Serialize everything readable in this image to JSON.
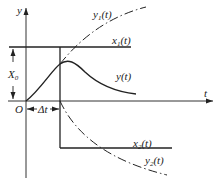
{
  "diagram": {
    "type": "signal-response-plot",
    "axes": {
      "y_label": "y",
      "x_label": "t",
      "origin_label": "O"
    },
    "annotations": {
      "x0_label": "X",
      "x0_sub": "0",
      "delay_label": "Δt"
    },
    "curves": [
      {
        "name": "y1",
        "label": "y",
        "sub": "1",
        "arg": "(t)",
        "style": "dash-dot",
        "description": "rising curve"
      },
      {
        "name": "x1",
        "label": "x",
        "sub": "1",
        "arg": "(t)",
        "style": "solid",
        "description": "step input of height X0 at t=Δt"
      },
      {
        "name": "y",
        "label": "y",
        "sub": "",
        "arg": "(t)",
        "style": "solid",
        "description": "output rising to peak at Δt then decaying"
      },
      {
        "name": "x2",
        "label": "x",
        "sub": "2",
        "arg": "(t)",
        "style": "solid",
        "description": "negative step starting at Δt"
      },
      {
        "name": "y2",
        "label": "y",
        "sub": "2",
        "arg": "(t)",
        "style": "dash-dot",
        "description": "falling curve"
      }
    ],
    "colors": {
      "line": "#222222",
      "axis": "#333333"
    }
  }
}
